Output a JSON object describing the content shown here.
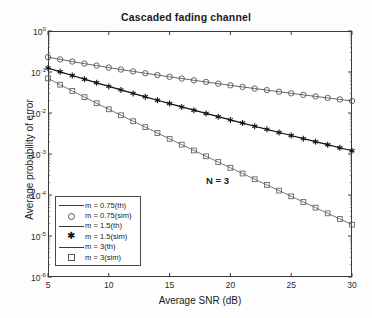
{
  "chart_data": {
    "type": "line",
    "title": "Cascaded fading channel",
    "xlabel": "Average SNR (dB)",
    "ylabel": "Average probability of error",
    "xlim": [
      5,
      30
    ],
    "ylim": [
      1e-06,
      1
    ],
    "yscale": "log",
    "xticks": [
      5,
      10,
      15,
      20,
      25,
      30
    ],
    "ytick_labels": [
      "10<sup>0</sup>",
      "10<sup>-1</sup>",
      "10<sup>-2</sup>",
      "10<sup>-3</sup>",
      "10<sup>-4</sup>",
      "10<sup>-5</sup>",
      "10<sup>-6</sup>"
    ],
    "ytick_values": [
      1,
      0.1,
      0.01,
      0.001,
      0.0001,
      1e-05,
      1e-06
    ],
    "grid": false,
    "legend_position": "lower left",
    "annotations": [
      {
        "text": "N = 3",
        "x": 18.0,
        "y": 0.00022
      }
    ],
    "x": [
      5,
      6,
      7,
      8,
      9,
      10,
      11,
      12,
      13,
      14,
      15,
      16,
      17,
      18,
      19,
      20,
      21,
      22,
      23,
      24,
      25,
      26,
      27,
      28,
      29,
      30
    ],
    "series": [
      {
        "name": "m = 0.75(th)",
        "marker": "none",
        "style": "line",
        "color": "#555555",
        "values": [
          0.23,
          0.203,
          0.18,
          0.16,
          0.143,
          0.128,
          0.115,
          0.1035,
          0.0933,
          0.0843,
          0.0763,
          0.0692,
          0.0628,
          0.0571,
          0.052,
          0.0474,
          0.0432,
          0.0395,
          0.0361,
          0.033,
          0.0302,
          0.0277,
          0.0254,
          0.0233,
          0.0214,
          0.0197
        ]
      },
      {
        "name": "m = 0.75(sim)",
        "marker": "circle",
        "style": "marker",
        "color": "#555555",
        "values": [
          0.23,
          0.203,
          0.18,
          0.16,
          0.143,
          0.128,
          0.115,
          0.1035,
          0.0933,
          0.0843,
          0.0763,
          0.0692,
          0.0628,
          0.0571,
          0.052,
          0.0474,
          0.0432,
          0.0395,
          0.0361,
          0.033,
          0.0302,
          0.0277,
          0.0254,
          0.0233,
          0.0214,
          0.0197
        ]
      },
      {
        "name": "m = 1.5(th)",
        "marker": "none",
        "style": "line",
        "color": "#111111",
        "values": [
          0.125,
          0.101,
          0.082,
          0.0668,
          0.0545,
          0.0446,
          0.0366,
          0.0301,
          0.0248,
          0.0205,
          0.017,
          0.0141,
          0.0117,
          0.00975,
          0.00813,
          0.00679,
          0.00568,
          0.00476,
          0.00399,
          0.00335,
          0.00282,
          0.00237,
          0.002,
          0.00169,
          0.00142,
          0.0012
        ]
      },
      {
        "name": "m = 1.5(sim)",
        "marker": "asterisk",
        "style": "marker",
        "color": "#111111",
        "values": [
          0.125,
          0.101,
          0.082,
          0.0668,
          0.0545,
          0.0446,
          0.0366,
          0.0301,
          0.0248,
          0.0205,
          0.017,
          0.0141,
          0.0117,
          0.00975,
          0.00813,
          0.00679,
          0.00568,
          0.00476,
          0.00399,
          0.00335,
          0.00282,
          0.00237,
          0.002,
          0.00169,
          0.00142,
          0.0012
        ]
      },
      {
        "name": "m = 3(th)",
        "marker": "none",
        "style": "line",
        "color": "#666666",
        "values": [
          0.07,
          0.049,
          0.0345,
          0.0244,
          0.0173,
          0.0123,
          0.0088,
          0.0063,
          0.00452,
          0.00325,
          0.00234,
          0.00169,
          0.00122,
          0.00088,
          0.000637,
          0.000461,
          0.000334,
          0.000242,
          0.000176,
          0.000128,
          9.28e-05,
          6.75e-05,
          4.91e-05,
          3.57e-05,
          2.6e-05,
          1.89e-05
        ]
      },
      {
        "name": "m = 3(sim)",
        "marker": "square",
        "style": "marker",
        "color": "#666666",
        "values": [
          0.07,
          0.049,
          0.0345,
          0.0244,
          0.0173,
          0.0123,
          0.0088,
          0.0063,
          0.00452,
          0.00325,
          0.00234,
          0.00169,
          0.00122,
          0.00088,
          0.000637,
          0.000461,
          0.000334,
          0.000242,
          0.000176,
          0.000128,
          9.28e-05,
          6.75e-05,
          4.91e-05,
          3.57e-05,
          2.6e-05,
          1.89e-05
        ]
      }
    ],
    "legend_entries": [
      {
        "label": "m = 0.75(th)",
        "key": "line"
      },
      {
        "label": "m = 0.75(sim)",
        "key": "circle"
      },
      {
        "label": "m = 1.5(th)",
        "key": "line"
      },
      {
        "label": "m = 1.5(sim)",
        "key": "asterisk"
      },
      {
        "label": "m = 3(th)",
        "key": "line"
      },
      {
        "label": "m = 3(sim)",
        "key": "square"
      }
    ]
  }
}
